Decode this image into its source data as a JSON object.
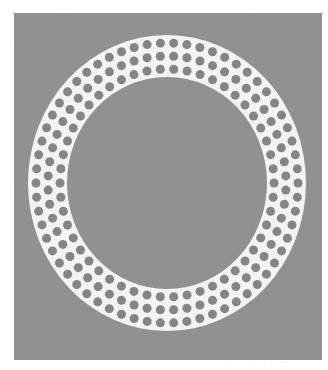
{
  "image": {
    "subject": "perforated white ring gasket on gray background",
    "page_background": "#ffffff",
    "backdrop": {
      "x": 14,
      "y": 13,
      "width": 308,
      "height": 347,
      "color": "#8e8e8e"
    },
    "ring": {
      "color": "#f3f3f3",
      "center": [
        167,
        183
      ],
      "outer_radius": [
        139,
        148
      ],
      "inner_radius": [
        100,
        106
      ],
      "hole_color": "#858585",
      "hole_diameter": 9,
      "hole_rows": [
        {
          "rx": 131,
          "ry": 140,
          "count": 62,
          "offset": 0
        },
        {
          "rx": 119,
          "ry": 127,
          "count": 56,
          "offset": 0.5
        },
        {
          "rx": 107,
          "ry": 114,
          "count": 50,
          "offset": 0
        }
      ]
    },
    "caption": "· · · · · · · ·  · · ·"
  }
}
